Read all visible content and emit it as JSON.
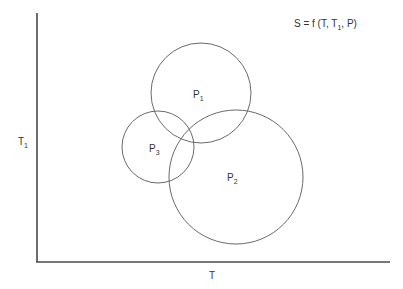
{
  "diagram": {
    "formula": {
      "lhs": "S = f (T, T",
      "sub": "1",
      "rhs": ", P)"
    },
    "axes": {
      "x_label": "T",
      "y_label": "T",
      "y_label_sub": "1"
    },
    "regions": [
      {
        "id": "P1",
        "label": "P",
        "sub": "1"
      },
      {
        "id": "P2",
        "label": "P",
        "sub": "2"
      },
      {
        "id": "P3",
        "label": "P",
        "sub": "3"
      }
    ]
  }
}
